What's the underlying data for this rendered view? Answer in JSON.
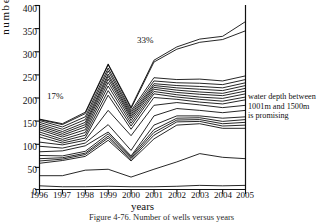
{
  "figure": {
    "caption": "Figure 4-76. Number of wells versus years",
    "annotations": [
      {
        "name": "pct-17",
        "text": "17%"
      },
      {
        "name": "pct-33",
        "text": "33%"
      }
    ],
    "note": {
      "line1": "water depth between",
      "line2": "1001m and 1500m",
      "line3": "is promising"
    }
  },
  "chart_data": {
    "type": "line",
    "title": "Figure 4-76. Number of wells versus years",
    "xlabel": "years",
    "ylabel": "number of wells",
    "x": [
      1996,
      1997,
      1998,
      1999,
      2000,
      2001,
      2002,
      2003,
      2004,
      2005
    ],
    "xtick_labels": [
      "1996",
      "1997",
      "1998",
      "1999",
      "2000",
      "2001",
      "2002",
      "2003",
      "2004",
      "2005"
    ],
    "ylim": [
      0,
      400
    ],
    "ytick_labels": [
      "0",
      "50",
      "100",
      "150",
      "200",
      "250",
      "300",
      "350",
      "400"
    ],
    "yticks": [
      0,
      50,
      100,
      150,
      200,
      250,
      300,
      350,
      400
    ],
    "grid": false,
    "legend": "none",
    "annotations": [
      {
        "text": "17%",
        "x": 1996.8,
        "y": 200
      },
      {
        "text": "33%",
        "x": 1999.8,
        "y": 325
      },
      {
        "text": "water depth between 1001m and 1500m is promising",
        "x": 2005,
        "y": 205
      }
    ],
    "series": [
      {
        "name": "cum-01",
        "values": [
          8,
          6,
          6,
          7,
          6,
          6,
          7,
          9,
          8,
          9
        ]
      },
      {
        "name": "cum-02",
        "values": [
          30,
          30,
          42,
          44,
          27,
          44,
          60,
          78,
          70,
          67
        ]
      },
      {
        "name": "cum-03",
        "values": [
          57,
          63,
          72,
          107,
          62,
          110,
          140,
          143,
          133,
          133
        ]
      },
      {
        "name": "cum-04",
        "values": [
          62,
          66,
          76,
          112,
          65,
          118,
          147,
          148,
          138,
          140
        ]
      },
      {
        "name": "cum-05",
        "values": [
          67,
          69,
          79,
          116,
          68,
          124,
          151,
          152,
          143,
          146
        ]
      },
      {
        "name": "cum-06",
        "values": [
          74,
          73,
          83,
          121,
          71,
          130,
          155,
          156,
          148,
          152
        ]
      },
      {
        "name": "cum-07",
        "values": [
          82,
          84,
          95,
          125,
          73,
          140,
          160,
          160,
          155,
          158
        ]
      },
      {
        "name": "cum-08",
        "values": [
          94,
          90,
          101,
          141,
          85,
          160,
          176,
          172,
          167,
          172
        ]
      },
      {
        "name": "cum-09",
        "values": [
          103,
          97,
          107,
          172,
          117,
          183,
          189,
          184,
          178,
          183
        ]
      },
      {
        "name": "cum-10",
        "values": [
          114,
          101,
          112,
          205,
          131,
          200,
          196,
          190,
          186,
          195
        ]
      },
      {
        "name": "cum-11",
        "values": [
          120,
          105,
          118,
          215,
          138,
          208,
          201,
          196,
          192,
          201
        ]
      },
      {
        "name": "cum-12",
        "values": [
          125,
          109,
          124,
          225,
          144,
          213,
          206,
          201,
          198,
          208
        ]
      },
      {
        "name": "cum-13",
        "values": [
          130,
          114,
          130,
          233,
          150,
          218,
          211,
          207,
          204,
          214
        ]
      },
      {
        "name": "cum-14",
        "values": [
          134,
          118,
          136,
          240,
          155,
          222,
          216,
          212,
          209,
          220
        ]
      },
      {
        "name": "cum-15",
        "values": [
          138,
          122,
          141,
          246,
          159,
          226,
          221,
          218,
          215,
          226
        ]
      },
      {
        "name": "cum-16",
        "values": [
          142,
          126,
          146,
          251,
          163,
          230,
          226,
          224,
          221,
          232
        ]
      },
      {
        "name": "cum-17",
        "values": [
          146,
          131,
          152,
          258,
          167,
          236,
          232,
          231,
          228,
          239
        ]
      },
      {
        "name": "cum-18",
        "values": [
          150,
          136,
          158,
          264,
          171,
          243,
          239,
          240,
          236,
          247
        ]
      },
      {
        "name": "cum-19",
        "values": [
          152,
          141,
          165,
          271,
          176,
          277,
          305,
          320,
          326,
          345
        ]
      },
      {
        "name": "cum-20",
        "values": [
          153,
          143,
          168,
          273,
          179,
          281,
          310,
          327,
          333,
          365
        ]
      }
    ]
  }
}
